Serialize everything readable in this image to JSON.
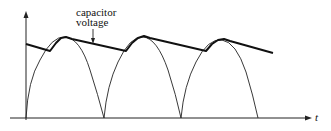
{
  "diagram": {
    "annotation": {
      "line1": "capacitor",
      "line2": "voltage"
    },
    "x_axis_label": "t",
    "colors": {
      "stroke": "#1a1a1a",
      "background": "#ffffff"
    }
  }
}
